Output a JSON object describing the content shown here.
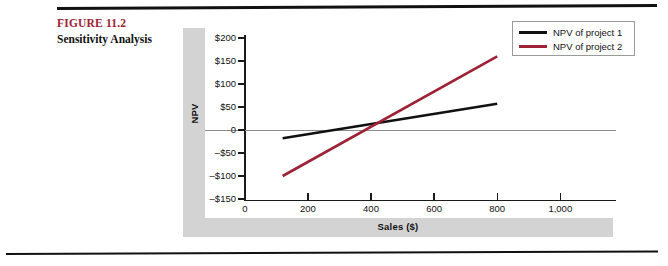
{
  "figure": {
    "number": "FIGURE 11.2",
    "title": "Sensitivity Analysis"
  },
  "colors": {
    "figure_number": "#9e2235",
    "series_1": "#111111",
    "series_2": "#9e2235",
    "band": "#d3d3d3",
    "axis": "#1a1a1a",
    "zero_line": "#8c8c8c"
  },
  "chart_data": {
    "type": "line",
    "title": "Sensitivity Analysis",
    "xlabel": "Sales ($)",
    "ylabel": "NPV",
    "xlim": [
      0,
      1100
    ],
    "ylim": [
      -150,
      200
    ],
    "grid": false,
    "legend_position": "top-right",
    "x_ticks": [
      0,
      200,
      400,
      600,
      800,
      1000
    ],
    "x_tick_labels": [
      "0",
      "200",
      "400",
      "600",
      "800",
      "1,000"
    ],
    "y_ticks": [
      200,
      150,
      100,
      50,
      0,
      -50,
      -100,
      -150
    ],
    "y_tick_labels": [
      "$200",
      "$150",
      "$100",
      "$50",
      "0",
      "–$50",
      "–$100",
      "–$150"
    ],
    "zero_line": 0,
    "series": [
      {
        "name": "NPV of project 1",
        "color": "#111111",
        "x": [
          120,
          800
        ],
        "values": [
          -18,
          57
        ]
      },
      {
        "name": "NPV of project 2",
        "color": "#9e2235",
        "x": [
          120,
          800
        ],
        "values": [
          -100,
          160
        ]
      }
    ],
    "crossover": {
      "x": 400,
      "y": 0
    }
  },
  "legend": {
    "items": [
      {
        "label": "NPV of project 1",
        "color": "#111111"
      },
      {
        "label": "NPV of project 2",
        "color": "#9e2235"
      }
    ]
  }
}
